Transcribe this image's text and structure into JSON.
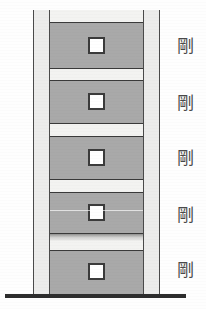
{
  "diagram": {
    "type": "building-elevation",
    "colors": {
      "panel_gray": "#a9a9a9",
      "column_gray": "#ececeb",
      "spandrel_white": "#f3f3f1",
      "outline_dark": "#3a3a3a",
      "ground_dark": "#2d2d2d",
      "label_gray": "#4a4a4a"
    },
    "ground": {
      "label": "ground-line"
    },
    "building": {
      "left_column_label": "left-column",
      "right_column_label": "right-column",
      "storey_count": 5
    },
    "storeys": [
      {
        "index": 1,
        "position": "top",
        "panel_top": 12,
        "panel_height": 47,
        "window_top": 27,
        "label": "剛",
        "label_top": 38,
        "damaged": false
      },
      {
        "index": 2,
        "position": "fourth",
        "panel_top": 70,
        "panel_height": 44,
        "window_top": 83,
        "label": "剛",
        "label_top": 95,
        "damaged": false
      },
      {
        "index": 3,
        "position": "third",
        "panel_top": 126,
        "panel_height": 44,
        "window_top": 139,
        "label": "剛",
        "label_top": 150,
        "damaged": false
      },
      {
        "index": 4,
        "position": "second",
        "panel_top": 182,
        "panel_height": 42,
        "window_top": 194,
        "label": "剛",
        "label_top": 207,
        "damaged": true
      },
      {
        "index": 5,
        "position": "first",
        "panel_top": 240,
        "panel_height": 46,
        "window_top": 253,
        "label": "剛",
        "label_top": 262,
        "damaged": false
      }
    ],
    "annotations": {
      "rigid_symbol": "剛",
      "rigid_meaning": "rigid"
    }
  }
}
